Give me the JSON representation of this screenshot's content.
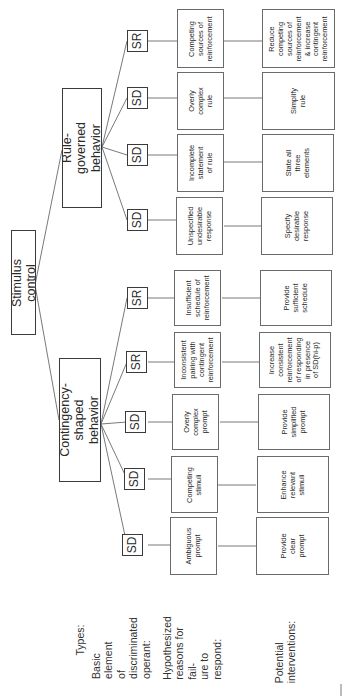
{
  "root": {
    "label": "Stimulus control"
  },
  "types": [
    {
      "id": "rule",
      "label": "Rule-\ngoverned behavior"
    },
    {
      "id": "contingency",
      "label": "Contingency-\nshaped behavior"
    }
  ],
  "row_labels": {
    "types": "Types:",
    "basic_element": "Basic element\nof discriminated\noperant:",
    "reasons": "Hypothesized\nreasons for fail-\nure to respond:",
    "interventions": "Potential\ninterventions:"
  },
  "branches": [
    {
      "type": "rule",
      "element": "SR",
      "reason": "Competing\nsources of\nreinforcement",
      "intervention": "Reduce\ncompeting\nsources of\nreinforcement\n& increase\ncontingent\nreinforcement"
    },
    {
      "type": "rule",
      "element": "SD",
      "reason": "Overly\ncomplex\nrule",
      "intervention": "Simplify\nrule"
    },
    {
      "type": "rule",
      "element": "SD",
      "reason": "Incomplete\nstatement\nof rule",
      "intervention": "State all\nthree\nelements"
    },
    {
      "type": "rule",
      "element": "SD",
      "reason": "Unspecified\nundesirable\nresponse",
      "intervention": "Specify\ndesirable\nresponse"
    },
    {
      "type": "contingency",
      "element": "SR",
      "reason": "Insufficient\nschedule of\nreinforcement",
      "intervention": "Provide\nsufficient\nschedule"
    },
    {
      "type": "contingency",
      "element": "SR",
      "reason": "Inconsistent\npairing with\ncontingent\nreinforcement",
      "intervention": "Increase\nconsistent\nreinforcement\nof responding\nin presence\nof SD(hi-p)"
    },
    {
      "type": "contingency",
      "element": "SD",
      "reason": "Overly\ncomplex\nprompt",
      "intervention": "Provide\nsimplified\nprompt"
    },
    {
      "type": "contingency",
      "element": "SD",
      "reason": "Competing\nstimuli",
      "intervention": "Enhance\nrelevant\nstimuli"
    },
    {
      "type": "contingency",
      "element": "SD",
      "reason": "Ambiguous\nprompt",
      "intervention": "Provide\nclear\nprompt"
    }
  ],
  "colors": {
    "line": "#6a6a6a",
    "text": "#2a2a2a",
    "background": "#ffffff"
  }
}
